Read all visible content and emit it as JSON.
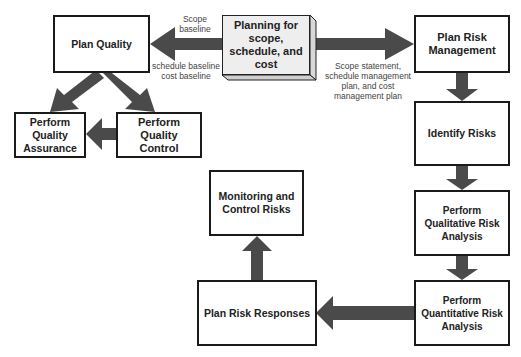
{
  "diagram": {
    "type": "process-flow",
    "colors": {
      "arrow": "#4a4a4a",
      "box_border": "#1a1a1a",
      "planning_fill": "#eeeeee",
      "background": "#ffffff"
    },
    "nodes": {
      "planning": "Planning for\nscope,\nschedule, and\ncost",
      "plan_quality": "Plan Quality",
      "perform_quality_assurance": "Perform\nQuality\nAssurance",
      "perform_quality_control": "Perform Quality\nControl",
      "plan_risk_management": "Plan Risk\nManagement",
      "identify_risks": "Identify Risks",
      "qualitative_risk_analysis": "Perform\nQualitative Risk\nAnalysis",
      "quantitative_risk_analysis": "Perform\nQuantitative Risk\nAnalysis",
      "plan_risk_responses": "Plan Risk Responses",
      "monitoring_control_risks": "Monitoring and\nControl Risks"
    },
    "edge_labels": {
      "scope_baseline": "Scope\nbaseline",
      "schedule_cost_baseline": "schedule baseline\ncost baseline",
      "risk_inputs": "Scope statement,\nschedule management\nplan, and cost\nmanagement plan"
    },
    "edges": [
      {
        "from": "planning",
        "to": "plan_quality"
      },
      {
        "from": "planning",
        "to": "plan_risk_management"
      },
      {
        "from": "plan_quality",
        "to": "perform_quality_assurance"
      },
      {
        "from": "plan_quality",
        "to": "perform_quality_control"
      },
      {
        "from": "perform_quality_control",
        "to": "perform_quality_assurance"
      },
      {
        "from": "plan_risk_management",
        "to": "identify_risks"
      },
      {
        "from": "identify_risks",
        "to": "qualitative_risk_analysis"
      },
      {
        "from": "qualitative_risk_analysis",
        "to": "quantitative_risk_analysis"
      },
      {
        "from": "quantitative_risk_analysis",
        "to": "plan_risk_responses"
      },
      {
        "from": "plan_risk_responses",
        "to": "monitoring_control_risks"
      }
    ]
  }
}
